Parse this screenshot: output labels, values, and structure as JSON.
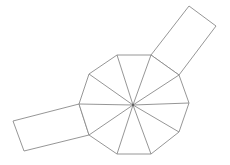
{
  "diagram": {
    "decagon": {
      "sides": 10,
      "triangles": 10
    },
    "rectangles": [
      {
        "name": "upper-right-rectangle",
        "attached_to": "decagon-edge"
      },
      {
        "name": "lower-left-rectangle",
        "attached_to": "decagon-edge"
      }
    ],
    "colors": {
      "stroke": "#8a8a8a",
      "background": "#ffffff"
    }
  }
}
